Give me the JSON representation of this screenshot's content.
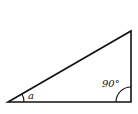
{
  "diagram": {
    "type": "right-triangle",
    "angles": {
      "acute_label": "a",
      "right_label": "90°"
    },
    "colors": {
      "stroke": "#111111",
      "background": "#ffffff"
    }
  }
}
